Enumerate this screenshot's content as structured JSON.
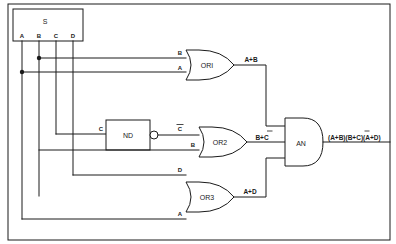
{
  "diagram": {
    "type": "logic-circuit-schematic",
    "title": "",
    "source_block": {
      "label": "S",
      "outputs": [
        "A",
        "B",
        "C",
        "D"
      ]
    },
    "gates": [
      {
        "id": "or1",
        "label": "OR1",
        "type": "OR",
        "inputs": [
          "B",
          "A"
        ],
        "output": "A+B"
      },
      {
        "id": "nd",
        "label": "ND",
        "type": "NAND",
        "inputs": [
          "C"
        ],
        "output": "C"
      },
      {
        "id": "or2",
        "label": "OR2",
        "type": "OR",
        "inputs": [
          "C",
          "B"
        ],
        "output": "B+C"
      },
      {
        "id": "or3",
        "label": "OR3",
        "type": "OR",
        "inputs": [
          "D",
          "A"
        ],
        "output": "A+D"
      },
      {
        "id": "an",
        "label": "AN",
        "type": "AND",
        "inputs": [
          "A+B",
          "B+C",
          "A+D"
        ],
        "output": "(A+B)(B+C)(A+D)"
      }
    ],
    "labels": {
      "source": "S",
      "src_a": "A",
      "src_b": "B",
      "src_c": "C",
      "src_d": "D",
      "or1_in_top": "B",
      "or1_in_bot": "A",
      "or1_name": "ORI",
      "or1_out": "A+B",
      "nd_in": "C",
      "nd_name": "ND",
      "nd_out_base": "C",
      "or2_in_top_base": "C",
      "or2_in_bot": "B",
      "or2_name": "OR2",
      "or2_out_pre": "B+",
      "or2_out_bar": "C",
      "or3_in_top": "D",
      "or3_in_bot": "A",
      "or3_name": "OR3",
      "or3_out": "A+D",
      "and_name": "AN",
      "final_p1": "(A+B)(B+",
      "final_bar": "C",
      "final_p2": ")(A+D)"
    },
    "colors": {
      "line": "#1a1a1a",
      "background": "#ffffff",
      "fill": "#ffffff"
    }
  }
}
